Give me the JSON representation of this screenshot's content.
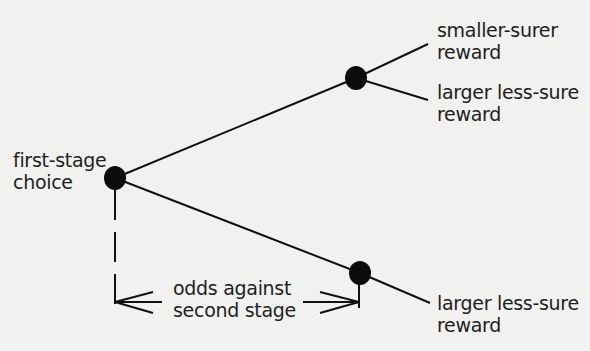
{
  "diagram": {
    "type": "decision-tree",
    "colors": {
      "background": "#f1f1f0",
      "ink": "#111111",
      "text": "#1e1e1e"
    },
    "nodes": [
      {
        "id": "first-stage",
        "label_lines": [
          "first-stage",
          "choice"
        ]
      },
      {
        "id": "second-stage-upper"
      },
      {
        "id": "second-stage-lower"
      }
    ],
    "outcomes": {
      "upper_smaller": {
        "lines": [
          "smaller-surer",
          "reward"
        ]
      },
      "upper_larger": {
        "lines": [
          "larger less-sure",
          "reward"
        ]
      },
      "lower_larger": {
        "lines": [
          "larger less-sure",
          "reward"
        ]
      }
    },
    "annotation": {
      "lines": [
        "odds against",
        "second stage"
      ]
    }
  }
}
